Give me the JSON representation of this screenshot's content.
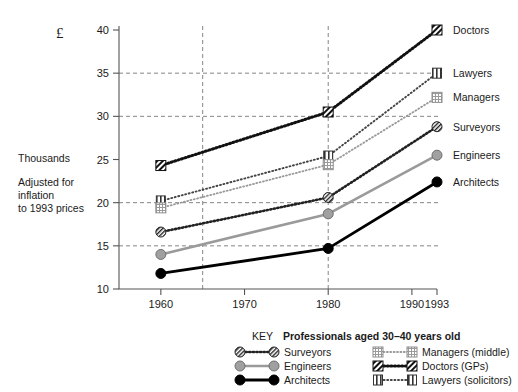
{
  "figure": {
    "currency_symbol": "£",
    "side_notes": [
      "Thousands",
      "Adjusted for",
      "inflation",
      "to 1993 prices"
    ],
    "key_word": "KEY",
    "key_title": "Professionals aged 30–40 years old"
  },
  "chart_data": {
    "type": "line",
    "title": "",
    "xlabel": "",
    "ylabel": "Thousands",
    "x": [
      1960,
      1980,
      1993
    ],
    "xtick_labels": [
      "1960",
      "1970",
      "1980",
      "1990",
      "1993"
    ],
    "xticks": [
      1960,
      1970,
      1980,
      1990,
      1993
    ],
    "xlim": [
      1955,
      1993
    ],
    "ytick_labels": [
      "10",
      "15",
      "20",
      "25",
      "30",
      "35",
      "40"
    ],
    "yticks": [
      10,
      15,
      20,
      25,
      30,
      35,
      40
    ],
    "ylim": [
      10,
      40
    ],
    "grid": "horizontal-dashed-plus-vertical-at-1965-1980",
    "gridlines_y": [
      15,
      20,
      30,
      35
    ],
    "gridlines_x": [
      1965,
      1980
    ],
    "legend_position": "bottom",
    "series": [
      {
        "name": "Doctors",
        "key_label": "Doctors (GPs)",
        "end_label": "Doctors",
        "values": [
          24.3,
          30.5,
          40.0
        ],
        "color": "#111111",
        "style": "dotted-thick",
        "marker": "hatch-dark-square"
      },
      {
        "name": "Lawyers",
        "key_label": "Lawyers (solicitors)",
        "end_label": "Lawyers",
        "values": [
          20.2,
          25.4,
          35.0
        ],
        "color": "#444444",
        "style": "dotted-fine",
        "marker": "vertical-bars-square"
      },
      {
        "name": "Managers",
        "key_label": "Managers (middle)",
        "end_label": "Managers",
        "values": [
          19.4,
          24.4,
          32.2
        ],
        "color": "#999999",
        "style": "dotted-light",
        "marker": "crosshatch-square"
      },
      {
        "name": "Surveyors",
        "key_label": "Surveyors",
        "end_label": "Surveyors",
        "values": [
          16.6,
          20.6,
          28.8
        ],
        "color": "#222222",
        "style": "dotted-medium",
        "marker": "hatch-circle"
      },
      {
        "name": "Engineers",
        "key_label": "Engineers",
        "end_label": "Engineers",
        "values": [
          14.0,
          18.7,
          25.5
        ],
        "color": "#9a9a9a",
        "style": "solid-grey",
        "marker": "grey-circle"
      },
      {
        "name": "Architects",
        "key_label": "Architects",
        "end_label": "Architects",
        "values": [
          11.8,
          14.7,
          22.4
        ],
        "color": "#000000",
        "style": "solid-black",
        "marker": "black-circle"
      }
    ]
  },
  "legend": {
    "column1": [
      "Surveyors",
      "Engineers",
      "Architects"
    ],
    "column2": [
      "Managers (middle)",
      "Doctors (GPs)",
      "Lawyers (solicitors)"
    ]
  }
}
